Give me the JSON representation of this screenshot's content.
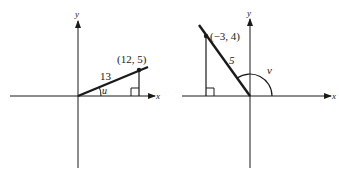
{
  "diagrams": [
    {
      "name": "left",
      "axis_x_label": "x",
      "axis_y_label": "y",
      "point_label": "(12, 5)",
      "hypotenuse_label": "13",
      "angle_label": "u"
    },
    {
      "name": "right",
      "axis_x_label": "x",
      "axis_y_label": "y",
      "point_label": "(−3, 4)",
      "hypotenuse_label": "5",
      "angle_label": "v"
    }
  ],
  "colors": {
    "ink": "#1a1a1a",
    "background": "#ffffff"
  }
}
